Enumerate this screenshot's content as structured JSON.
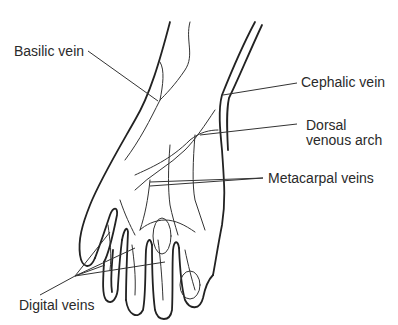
{
  "figure": {
    "labels": {
      "basilic": "Basilic vein",
      "cephalic": "Cephalic vein",
      "dorsal_line1": "Dorsal",
      "dorsal_line2": "venous arch",
      "metacarpal": "Metacarpal veins",
      "digital": "Digital veins"
    },
    "colors": {
      "background": "#ffffff",
      "line": "#222222",
      "text": "#2a2a2a"
    }
  }
}
